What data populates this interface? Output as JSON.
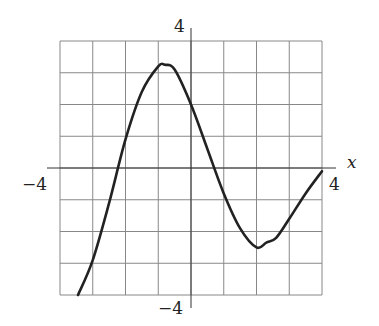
{
  "chart_data": {
    "type": "line",
    "title": "",
    "xlabel": "x",
    "ylabel": "",
    "xlim": [
      -4,
      4
    ],
    "ylim": [
      -4,
      4
    ],
    "grid": true,
    "grid_step": 1,
    "tick_labels": {
      "x_min": "−4",
      "x_max": "4",
      "y_max": "4",
      "y_min": "−4"
    },
    "series": [
      {
        "name": "f(x)",
        "x": [
          -3.45,
          -3.0,
          -2.5,
          -2.0,
          -1.5,
          -1.0,
          -0.8,
          -0.5,
          0.0,
          0.5,
          1.0,
          1.5,
          2.0,
          2.3,
          2.6,
          3.0,
          3.5,
          4.0
        ],
        "y": [
          -4.0,
          -2.9,
          -1.1,
          0.9,
          2.4,
          3.2,
          3.25,
          3.1,
          2.0,
          0.6,
          -0.8,
          -1.9,
          -2.5,
          -2.35,
          -2.2,
          -1.6,
          -0.8,
          -0.1
        ]
      }
    ]
  },
  "labels": {
    "x_axis": "x",
    "x_min": "−4",
    "x_max": "4",
    "y_max": "4",
    "y_min": "−4"
  }
}
